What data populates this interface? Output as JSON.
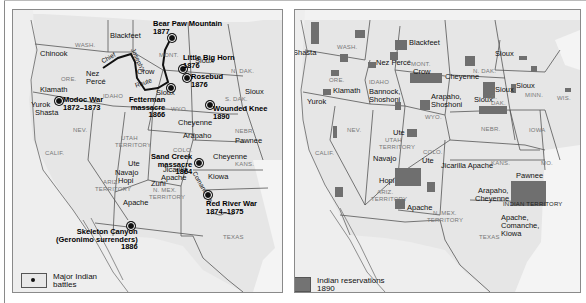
{
  "figure": {
    "panels": [
      {
        "id": "battles",
        "legend": {
          "line1": "Major Indian",
          "line2": "battles",
          "symbol": "battle-dot-icon"
        },
        "states": [
          "WASH.",
          "ORE.",
          "IDAHO",
          "NEV.",
          "CALIF.",
          "UTAH",
          "TERRITORY",
          "MONT.",
          "WYO.",
          "N. DAK.",
          "S. DAK.",
          "NEBR.",
          "COLO.",
          "KANS.",
          "ARIZ.",
          "TERRITORY",
          "N. MEX.",
          "TERRITORY",
          "TEXAS"
        ],
        "tribes": [
          "Blackfeet",
          "Chinook",
          "Nez Percé",
          "Klamath",
          "Yurok",
          "Shasta",
          "Crow",
          "Sioux",
          "Sioux",
          "Sioux",
          "Cheyenne",
          "Arapaho",
          "Pawnee",
          "Cheyenne",
          "Ute",
          "Navajo",
          "Hopi",
          "Zuñi",
          "Apache",
          "Jicarilla",
          "Apache",
          "Kiowa"
        ],
        "trails": {
          "chief_joseph_1": "Chief",
          "chief_joseph_2": "Joseph's",
          "bozeman": "Bozeman",
          "route": "Route",
          "comanche": "Comanches"
        },
        "battles": [
          {
            "name": "Bear Paw Mountain",
            "year": "1877"
          },
          {
            "name": "Little Big Horn",
            "year": "1876"
          },
          {
            "name": "Rosebud",
            "year": "1876"
          },
          {
            "name": "Fetterman",
            "name2": "massacre",
            "year": "1866"
          },
          {
            "name": "Modoc War",
            "year": "1872–1873"
          },
          {
            "name": "Wounded Knee",
            "year": "1890"
          },
          {
            "name": "Sand Creek",
            "name2": "massacre",
            "year": "1864"
          },
          {
            "name": "Red River War",
            "year": "1874–1875"
          },
          {
            "name": "Skeleton Canyon",
            "name2": "(Geronimo surrenders)",
            "year": "1886"
          }
        ]
      },
      {
        "id": "reservations",
        "legend": {
          "line1": "Indian reservations",
          "line2": "1890",
          "swatch_color": "#737373"
        },
        "states": [
          "WASH.",
          "ORE.",
          "IDAHO",
          "NEV.",
          "CALIF.",
          "UTAH",
          "TERRITORY",
          "MONT.",
          "WYO.",
          "N. DAK.",
          "S. DAK.",
          "MINN.",
          "WIS.",
          "IOWA",
          "NEBR.",
          "COLO.",
          "KANS.",
          "MO.",
          "ARIZ.",
          "TERRITORY",
          "N. MEX.",
          "TERRITORY",
          "TEXAS",
          "INDIAN TERRITORY"
        ],
        "tribes": {
          "shasta": "Shasta",
          "blackfeet": "Blackfeet",
          "nez_perce": "Nez Percé",
          "crow": "Crow",
          "klamath": "Klamath",
          "yurok": "Yurok",
          "bannock": "Bannock,",
          "shoshoni": "Shoshoni",
          "arapaho": "Arapaho,",
          "shoshoni2": "Shoshoni",
          "cheyenne": "Cheyenne",
          "sioux_nd": "Sioux",
          "sioux_sd": "Sioux",
          "sioux_mn": "Sioux",
          "sioux_ne": "Sioux",
          "ute": "Ute",
          "navajo": "Navajo",
          "hopi": "Hopi",
          "jicarilla": "Jicarilla Apache",
          "apache": "Apache",
          "pawnee": "Pawnee",
          "arapaho_ok": "Arapaho,",
          "cheyenne_ok": "Cheyenne",
          "acк": "Apache,",
          "comanche": "Comanche,",
          "kiowa": "Kiowa"
        }
      }
    ],
    "colors": {
      "land": "#e6e6e6",
      "border": "#8a8a8a",
      "reservation": "#6f6f6f",
      "ocean_mexico": "#eeeeee"
    }
  }
}
